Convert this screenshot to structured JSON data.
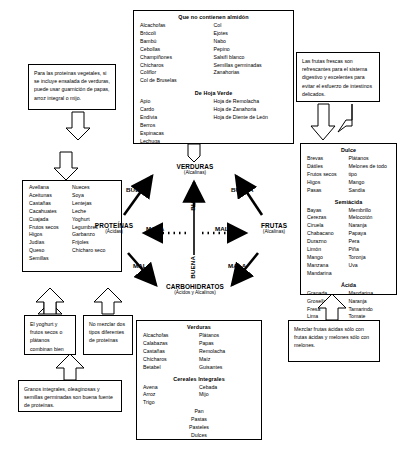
{
  "notes": {
    "vegetable_protein": "Para las proteínas vegetales, si se incluye ensalada de verduras, puede usar guarnición de papas, arroz integral o mijo.",
    "fresh_fruit": "Las frutas frescas son refrescantes para el sistema digestivo y excelentes para evitar el esfuerzo de intestinos delicados.",
    "yoghurt": "El yoghurt y frutos secos o plátanos combinan bien",
    "no_mix_proteins": "No mezclar dos tipos diferentes de proteínas",
    "grains": "Granos integrales, oleaginosas y semillas germinadas son buena fuente de proteínas.",
    "acid_fruits": "Mezclar frutas ácidas sólo con frutas ácidas y melones sólo con melones."
  },
  "starchless": {
    "title": "Que no contienen almidón",
    "col1": [
      "Alcachofas",
      "Brócoli",
      "Bambú",
      "Cebollas",
      "Champiñones",
      "Chícharos",
      "Coliflor",
      "Col de Bruselas"
    ],
    "col2": [
      "Col",
      "Ejotes",
      "Nabo",
      "Pepino",
      "Salsifí blanco",
      "Semillas germinadas",
      "Zanahorias"
    ],
    "green_title": "De Hoja Verde",
    "green1": [
      "Apio",
      "Cardo",
      "Endivia",
      "Berros",
      "Espinacas",
      "Lechuga"
    ],
    "green2": [
      "Hoja de Remolacha",
      "Hoja de Zanahoria",
      "Hoja de Diente de León"
    ]
  },
  "proteins_box": {
    "col1": [
      "Avellana",
      "Aceitunas",
      "Castañas",
      "Cacahuates",
      "Cuajada",
      "Frutos secos",
      "Higos",
      "Judías",
      "Queso",
      "Semillas"
    ],
    "col2": [
      "Nueces",
      "Soya",
      "Lentejas",
      "Leche",
      "Yoghurt",
      "Legumbres",
      "Garbanzo",
      "Frijoles",
      "Chícharo seco"
    ]
  },
  "fruits_box": {
    "sweet_title": "Dulce",
    "sweet1": [
      "Brevas",
      "Dátiles",
      "Frutos secos",
      "Higos",
      "Pasas"
    ],
    "sweet2": [
      "Plátanos",
      "Melones de todo tipo",
      "Mango",
      "Sandía"
    ],
    "semiacid_title": "Semiácida",
    "semi1": [
      "Bayas",
      "Cerezas",
      "Ciruela",
      "Chabacano",
      "Durazno",
      "Limón",
      "Mango",
      "Manzana",
      "Mandarina"
    ],
    "semi2": [
      "Membrillo",
      "Melocotón",
      "Naranja",
      "Papaya",
      "Pera",
      "Piña",
      "Toronja",
      "Uva"
    ],
    "acid_title": "Ácida",
    "acid1": [
      "Granada",
      "Grosella",
      "Fresa",
      "Lima"
    ],
    "acid2": [
      "Mandarina",
      "Naranja",
      "Tamarindo",
      "Tomate"
    ]
  },
  "carbs_box": {
    "veg_title": "Verduras",
    "veg1": [
      "Alcachofas",
      "Calabazas",
      "Castañas",
      "Chícharos",
      "Betabel"
    ],
    "veg2": [
      "Plátanos",
      "Papas",
      "Remolacha",
      "Maíz",
      "Guisantes"
    ],
    "cereal_title": "Cereales Integrales",
    "cer1": [
      "Avena",
      "Arroz",
      "Trigo"
    ],
    "cer2": [
      "Cebada",
      "Mijo"
    ],
    "others": [
      "Pan",
      "Pastas",
      "Pasteles",
      "Dulces"
    ]
  },
  "diagram": {
    "vegetables": "VERDURAS",
    "vegetables_sub": "(Alcalinas)",
    "fruits": "FRUTAS",
    "fruits_sub": "(Alcalinas)",
    "proteins": "PROTEÍNAS",
    "proteins_sub": "(Ácidas)",
    "carbs": "CARBOHIDRATOS",
    "carbs_sub": "(Ácidos y Alcalinos)",
    "good": "BUENA",
    "bad": "MALA"
  }
}
